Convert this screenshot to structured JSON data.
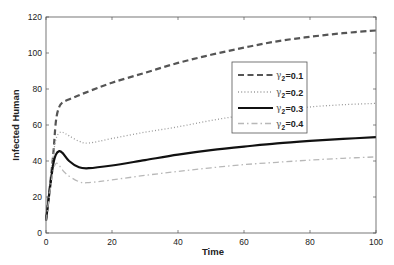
{
  "chart_data": {
    "type": "line",
    "title": "",
    "xlabel": "Time",
    "ylabel": "Infected Human",
    "xlim": [
      0,
      100
    ],
    "ylim": [
      0,
      120
    ],
    "xticks": [
      0,
      20,
      40,
      60,
      80,
      100
    ],
    "yticks": [
      0,
      20,
      40,
      60,
      80,
      100,
      120
    ],
    "grid": false,
    "legend_position": "inside-right-upper",
    "series": [
      {
        "name": "γ2=0.1",
        "symbol": "γ",
        "subscript": "2",
        "value_label": "=0.1",
        "color": "#555555",
        "style": "dashed",
        "width": 2.2,
        "points": [
          [
            0,
            7
          ],
          [
            2,
            40
          ],
          [
            3,
            62
          ],
          [
            4,
            70
          ],
          [
            5,
            72.5
          ],
          [
            8,
            75
          ],
          [
            12,
            78
          ],
          [
            20,
            83.5
          ],
          [
            30,
            89
          ],
          [
            40,
            94.5
          ],
          [
            50,
            99
          ],
          [
            60,
            103
          ],
          [
            70,
            106.5
          ],
          [
            80,
            109
          ],
          [
            90,
            111
          ],
          [
            100,
            112.5
          ]
        ]
      },
      {
        "name": "γ2=0.2",
        "symbol": "γ",
        "subscript": "2",
        "value_label": "=0.2",
        "color": "#9a9a9a",
        "style": "dotted",
        "width": 1.3,
        "points": [
          [
            0,
            7
          ],
          [
            2,
            40
          ],
          [
            3,
            52
          ],
          [
            4,
            55.5
          ],
          [
            5,
            56
          ],
          [
            7,
            54
          ],
          [
            10,
            51
          ],
          [
            13,
            50
          ],
          [
            20,
            52.5
          ],
          [
            30,
            56
          ],
          [
            40,
            59
          ],
          [
            50,
            62.5
          ],
          [
            60,
            65.5
          ],
          [
            70,
            68
          ],
          [
            80,
            70
          ],
          [
            90,
            71.3
          ],
          [
            100,
            72
          ]
        ]
      },
      {
        "name": "γ2=0.3",
        "symbol": "γ",
        "subscript": "2",
        "value_label": "=0.3",
        "color": "#111111",
        "style": "solid",
        "width": 2.2,
        "points": [
          [
            0,
            7
          ],
          [
            2,
            36
          ],
          [
            3,
            43.5
          ],
          [
            4,
            45.5
          ],
          [
            5,
            44.5
          ],
          [
            7,
            40
          ],
          [
            10,
            36.5
          ],
          [
            13,
            36
          ],
          [
            20,
            37.5
          ],
          [
            30,
            40.5
          ],
          [
            40,
            43.5
          ],
          [
            50,
            46
          ],
          [
            60,
            48
          ],
          [
            70,
            49.8
          ],
          [
            80,
            51.2
          ],
          [
            90,
            52.3
          ],
          [
            100,
            53.2
          ]
        ]
      },
      {
        "name": "γ2=0.4",
        "symbol": "γ",
        "subscript": "2",
        "value_label": "=0.4",
        "color": "#b8b8b8",
        "style": "dashdot",
        "width": 1.3,
        "points": [
          [
            0,
            7
          ],
          [
            2,
            33
          ],
          [
            3,
            38.5
          ],
          [
            4,
            37.5
          ],
          [
            6,
            33
          ],
          [
            10,
            28.5
          ],
          [
            13,
            28
          ],
          [
            20,
            29.5
          ],
          [
            30,
            32
          ],
          [
            40,
            34.2
          ],
          [
            50,
            36.2
          ],
          [
            60,
            38
          ],
          [
            70,
            39.3
          ],
          [
            80,
            40.5
          ],
          [
            90,
            41.5
          ],
          [
            100,
            42.3
          ]
        ]
      }
    ]
  }
}
